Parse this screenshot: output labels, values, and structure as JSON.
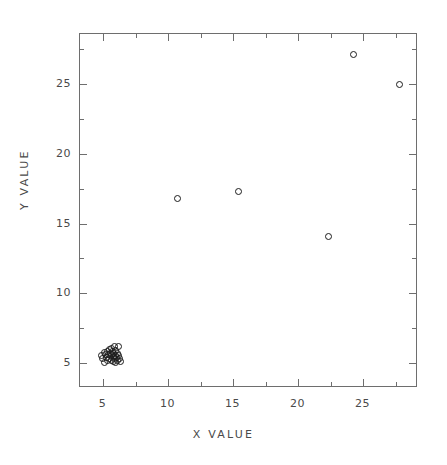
{
  "chart_data": {
    "type": "scatter",
    "title": "",
    "xlabel": "X VALUE",
    "ylabel": "Y VALUE",
    "xlim": [
      3.2,
      29.2
    ],
    "ylim": [
      3.2,
      28.6
    ],
    "grid": false,
    "legend": null,
    "xticks": [
      5,
      10,
      15,
      20,
      25
    ],
    "xtick_labels": [
      "5",
      "10",
      "15",
      "20",
      "25"
    ],
    "x_minor_ticks": [
      2.5,
      7.5,
      12.5,
      17.5,
      22.5,
      27.5
    ],
    "yticks": [
      5,
      10,
      15,
      20,
      25
    ],
    "ytick_labels": [
      "5",
      "10",
      "15",
      "20",
      "25"
    ],
    "y_minor_ticks": [
      2.5,
      7.5,
      12.5,
      17.5,
      22.5,
      27.5
    ],
    "marker": "open-circle",
    "marker_color": "#1c1c1c",
    "points": [
      {
        "x": 4.85,
        "y": 5.55
      },
      {
        "x": 4.95,
        "y": 5.3
      },
      {
        "x": 5.05,
        "y": 5.75
      },
      {
        "x": 5.1,
        "y": 5.05
      },
      {
        "x": 5.15,
        "y": 5.6
      },
      {
        "x": 5.25,
        "y": 5.4
      },
      {
        "x": 5.3,
        "y": 5.85
      },
      {
        "x": 5.35,
        "y": 5.15
      },
      {
        "x": 5.4,
        "y": 5.6
      },
      {
        "x": 5.45,
        "y": 5.95
      },
      {
        "x": 5.5,
        "y": 5.35
      },
      {
        "x": 5.55,
        "y": 5.7
      },
      {
        "x": 5.6,
        "y": 5.2
      },
      {
        "x": 5.6,
        "y": 6.05
      },
      {
        "x": 5.65,
        "y": 5.5
      },
      {
        "x": 5.7,
        "y": 5.8
      },
      {
        "x": 5.75,
        "y": 5.1
      },
      {
        "x": 5.75,
        "y": 5.45
      },
      {
        "x": 5.8,
        "y": 5.65
      },
      {
        "x": 5.85,
        "y": 6.2
      },
      {
        "x": 5.85,
        "y": 5.3
      },
      {
        "x": 5.9,
        "y": 5.55
      },
      {
        "x": 5.95,
        "y": 5.9
      },
      {
        "x": 5.95,
        "y": 5.05
      },
      {
        "x": 6.0,
        "y": 5.4
      },
      {
        "x": 6.05,
        "y": 5.7
      },
      {
        "x": 6.1,
        "y": 5.2
      },
      {
        "x": 6.15,
        "y": 6.15
      },
      {
        "x": 6.15,
        "y": 5.55
      },
      {
        "x": 6.25,
        "y": 5.35
      },
      {
        "x": 6.3,
        "y": 5.1
      },
      {
        "x": 10.7,
        "y": 16.8
      },
      {
        "x": 15.4,
        "y": 17.3
      },
      {
        "x": 22.3,
        "y": 14.1
      },
      {
        "x": 24.2,
        "y": 27.1
      },
      {
        "x": 27.8,
        "y": 25.0
      }
    ]
  },
  "axes": {
    "x_title": "X VALUE",
    "y_title": "Y VALUE"
  },
  "caption": ""
}
